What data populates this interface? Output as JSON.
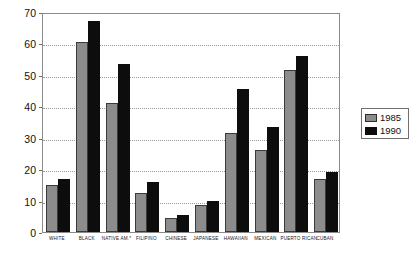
{
  "chart_data": {
    "type": "bar",
    "title": "",
    "subtitle": "",
    "xlabel": "",
    "ylabel": "",
    "ylim": [
      0,
      70
    ],
    "ytick_step": 10,
    "yticks": [
      "0",
      "10",
      "20",
      "30",
      "40",
      "50",
      "60",
      "70"
    ],
    "grid": true,
    "grid_axis": "y",
    "legend_position": "right",
    "categories": [
      "WHITE",
      "BLACK",
      "NATIVE AM.*",
      "FILIPINO",
      "CHINESE",
      "JAPANESE",
      "HAWAIIAN",
      "MEXICAN",
      "PUERTO RICAN",
      "CUBAN"
    ],
    "series": [
      {
        "name": "1985",
        "color": "#8c8c8c",
        "values": [
          15,
          60.5,
          41,
          12.5,
          4.5,
          8.5,
          31.5,
          26,
          51.5,
          17
        ]
      },
      {
        "name": "1990",
        "color": "#0d0d0d",
        "values": [
          17,
          67,
          53.5,
          16,
          5.5,
          10,
          45.5,
          33.5,
          56,
          19
        ]
      }
    ]
  },
  "legend": {
    "entries": [
      {
        "label": "1985"
      },
      {
        "label": "1990"
      }
    ]
  }
}
